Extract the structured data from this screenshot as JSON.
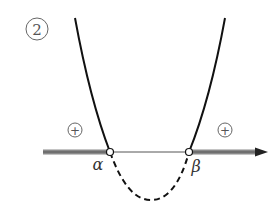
{
  "figure": {
    "number_label": "2",
    "root_left_label": "α",
    "root_right_label": "β",
    "sign_left": "+",
    "sign_right": "+",
    "colors": {
      "curve": "#111111",
      "axis": "#555555",
      "shaded_axis": "#8a8a8a",
      "open_point_fill": "#ffffff"
    }
  }
}
